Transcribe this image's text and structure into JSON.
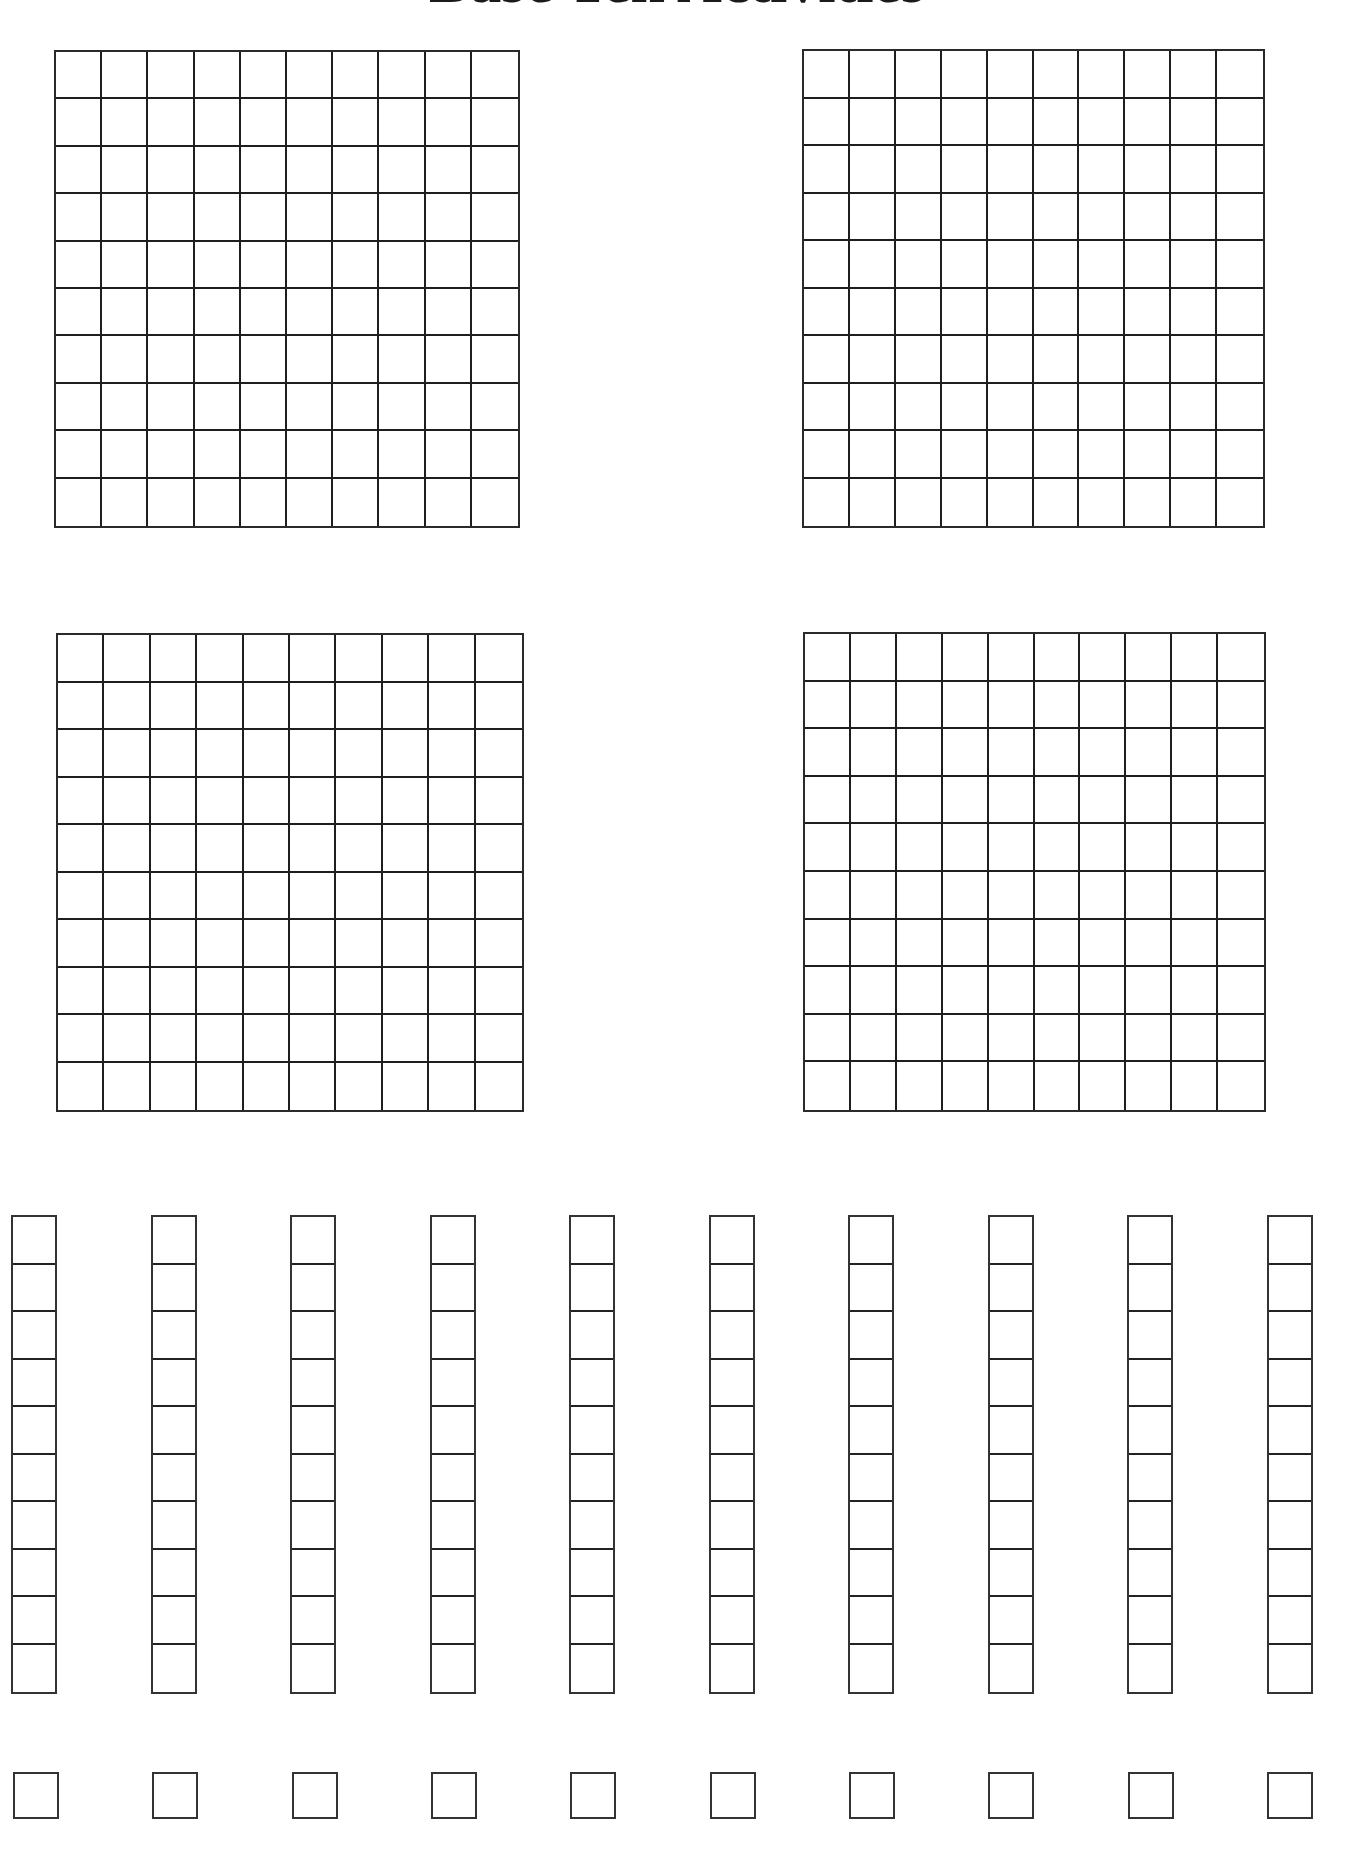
{
  "page": {
    "title": "Base Ten Activities"
  },
  "hundreds_flats": [
    {
      "label": "hundred-flat-1",
      "rows": 10,
      "cols": 10
    },
    {
      "label": "hundred-flat-2",
      "rows": 10,
      "cols": 10
    },
    {
      "label": "hundred-flat-3",
      "rows": 10,
      "cols": 10
    },
    {
      "label": "hundred-flat-4",
      "rows": 10,
      "cols": 10
    }
  ],
  "ten_rods": {
    "count": 10,
    "cells_per_rod": 10
  },
  "unit_cubes": {
    "count": 10
  },
  "colors": {
    "line": "#222222",
    "background": "#ffffff"
  }
}
